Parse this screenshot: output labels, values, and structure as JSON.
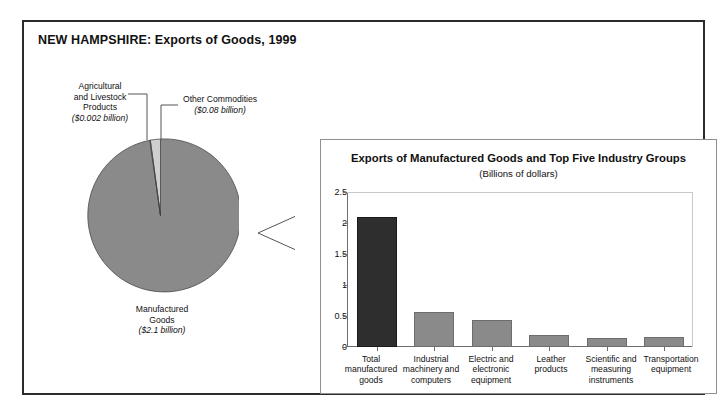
{
  "figure": {
    "title": "NEW HAMPSHIRE: Exports of Goods, 1999"
  },
  "pie_labels": {
    "agricultural_name_line1": "Agricultural",
    "agricultural_name_line2": "and Livestock",
    "agricultural_name_line3": "Products",
    "agricultural_value": "($0.002 billion)",
    "other_name": "Other Commodities",
    "other_value": "($0.08 billion)",
    "manufactured_name_line1": "Manufactured",
    "manufactured_name_line2": "Goods",
    "manufactured_value": "($2.1 billion)"
  },
  "panel": {
    "title": "Exports of Manufactured Goods and Top Five Industry Groups",
    "subtitle": "(Billions of dollars)"
  },
  "colors": {
    "bar_total": "#2e2e2e",
    "bar_group": "#8a8a8a",
    "pie_manufactured": "#8a8a8a",
    "pie_other": "#cfcfcf",
    "pie_agricultural": "#e8e8e8",
    "frame": "#2b2b2b",
    "axis": "#6e6e6e"
  },
  "chart_data": [
    {
      "type": "pie",
      "title": "Exports of Goods, 1999",
      "units": "Billions of dollars",
      "labels": [
        "Manufactured Goods",
        "Other Commodities",
        "Agricultural and Livestock Products"
      ],
      "values": [
        2.1,
        0.08,
        0.002
      ],
      "value_labels": [
        "($2.1 billion)",
        "($0.08 billion)",
        "($0.002 billion)"
      ],
      "colors": [
        "#8a8a8a",
        "#cfcfcf",
        "#e8e8e8"
      ],
      "legend": "none",
      "annotations": [
        "Leader lines connect the two small slices to labels above the pie"
      ]
    },
    {
      "type": "bar",
      "title": "Exports of Manufactured Goods and Top Five Industry Groups",
      "subtitle": "(Billions of dollars)",
      "categories": [
        "Total manufactured goods",
        "Industrial machinery and computers",
        "Electric and electronic equipment",
        "Leather products",
        "Scientific and measuring instruments",
        "Transportation equipment"
      ],
      "values": [
        2.1,
        0.56,
        0.43,
        0.2,
        0.14,
        0.16
      ],
      "xlabel": "",
      "ylabel": "",
      "ylim": [
        0,
        2.5
      ],
      "yticks": [
        0,
        0.5,
        1,
        1.5,
        2,
        2.5
      ],
      "ytick_labels": [
        "0",
        "0.5",
        "1",
        "1.5",
        "2",
        "2.5"
      ],
      "grid": false,
      "legend": "none",
      "bar_colors": [
        "#2e2e2e",
        "#8a8a8a",
        "#8a8a8a",
        "#8a8a8a",
        "#8a8a8a",
        "#8a8a8a"
      ]
    }
  ]
}
